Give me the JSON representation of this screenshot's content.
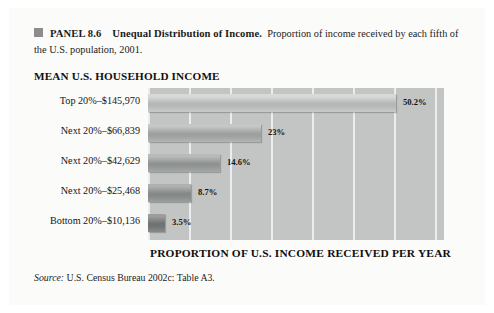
{
  "panel": {
    "bullet_icon": "filled-square-icon",
    "label": "PANEL 8.6",
    "title": "Unequal Distribution of Income.",
    "description": "Proportion of income received by each fifth of the U.S. population, 2001."
  },
  "chart_title": "MEAN U.S. HOUSEHOLD INCOME",
  "axis_title": "PROPORTION OF U.S. INCOME RECEIVED PER YEAR",
  "source": {
    "label": "Source:",
    "text": "U.S. Census Bureau 2002c: Table A3."
  },
  "colors": {
    "plot_background": "#c3c5c4",
    "gridline": "#eceded",
    "page_background": "#fbfbfa",
    "bullet": "#8c8c8c"
  },
  "chart_data": {
    "type": "bar",
    "orientation": "horizontal",
    "title": "MEAN U.S. HOUSEHOLD INCOME",
    "xlabel": "PROPORTION OF U.S. INCOME RECEIVED PER YEAR",
    "ylabel": "",
    "xlim": [
      0,
      60
    ],
    "grid": true,
    "legend": false,
    "categories": [
      "Top 20%–$145,970",
      "Next 20%–$66,839",
      "Next 20%–$42,629",
      "Next 20%–$25,468",
      "Bottom 20%–$10,136"
    ],
    "values": [
      50.2,
      23,
      14.6,
      8.7,
      3.5
    ],
    "value_labels": [
      "50.2%",
      "23%",
      "14.6%",
      "8.7%",
      "3.5%"
    ],
    "incomes": [
      "$145,970",
      "$66,839",
      "$42,629",
      "$25,468",
      "$10,136"
    ],
    "bar_colors": [
      "#b9bbba",
      "#a2a5a4",
      "#949897",
      "#8b8f8e",
      "#71perhaps"
    ],
    "bar_fill_top": [
      "#d8dad9",
      "#c5c7c6",
      "#b8bbba",
      "#aeb1b0",
      "#9a9d9c"
    ],
    "bar_fill_mid": [
      "#b6b8b7",
      "#9da09f",
      "#8f9392",
      "#858988",
      "#6f7372"
    ],
    "bar_fill_bottom": [
      "#c8cac9",
      "#b2b5b4",
      "#a5a8a7",
      "#9b9e9d",
      "#868a89"
    ]
  }
}
